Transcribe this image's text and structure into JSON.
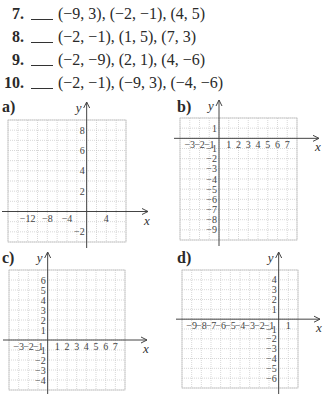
{
  "problems": [
    {
      "number": "7.",
      "points": "(−9, 3), (−2, −1), (4, 5)"
    },
    {
      "number": "8.",
      "points": "(−2, −1), (1, 5), (7, 3)"
    },
    {
      "number": "9.",
      "points": "(−2, −9), (2, 1), (4, −6)"
    },
    {
      "number": "10.",
      "points": "(−2, −1), (−9, 3), (−4, −6)"
    }
  ],
  "graphs": [
    {
      "label": "a)",
      "x_axis_label": "x",
      "y_axis_label": "y",
      "xmin": -16,
      "xmax": 8,
      "xstep": 2,
      "ymin": -3,
      "ymax": 9,
      "ystep": 1,
      "x_ticks": [
        {
          "v": -12,
          "t": "−12"
        },
        {
          "v": -8,
          "t": "−8"
        },
        {
          "v": -4,
          "t": "−4"
        },
        {
          "v": 4,
          "t": "4"
        }
      ],
      "y_ticks": [
        {
          "v": 8,
          "t": "8"
        },
        {
          "v": 6,
          "t": "6"
        },
        {
          "v": 4,
          "t": "4"
        },
        {
          "v": 2,
          "t": "2"
        },
        {
          "v": -2,
          "t": "−2"
        }
      ]
    },
    {
      "label": "b)",
      "x_axis_label": "x",
      "y_axis_label": "y",
      "xmin": -4,
      "xmax": 8,
      "xstep": 1,
      "ymin": -10,
      "ymax": 2,
      "ystep": 1,
      "x_ticks": [
        {
          "v": -3,
          "t": "−3"
        },
        {
          "v": -2,
          "t": "−2"
        },
        {
          "v": -1,
          "t": "−1"
        },
        {
          "v": 1,
          "t": "1"
        },
        {
          "v": 2,
          "t": "2"
        },
        {
          "v": 3,
          "t": "3"
        },
        {
          "v": 4,
          "t": "4"
        },
        {
          "v": 5,
          "t": "5"
        },
        {
          "v": 6,
          "t": "6"
        },
        {
          "v": 7,
          "t": "7"
        }
      ],
      "y_ticks": [
        {
          "v": 1,
          "t": "1"
        },
        {
          "v": -1,
          "t": "−1"
        },
        {
          "v": -2,
          "t": "−2"
        },
        {
          "v": -3,
          "t": "−3"
        },
        {
          "v": -4,
          "t": "−4"
        },
        {
          "v": -5,
          "t": "−5"
        },
        {
          "v": -6,
          "t": "−6"
        },
        {
          "v": -7,
          "t": "−7"
        },
        {
          "v": -8,
          "t": "−8"
        },
        {
          "v": -9,
          "t": "−9"
        }
      ]
    },
    {
      "label": "c)",
      "x_axis_label": "x",
      "y_axis_label": "y",
      "xmin": -4,
      "xmax": 8,
      "xstep": 1,
      "ymin": -5,
      "ymax": 7,
      "ystep": 1,
      "x_ticks": [
        {
          "v": -3,
          "t": "−3"
        },
        {
          "v": -2,
          "t": "−2"
        },
        {
          "v": -1,
          "t": "−1"
        },
        {
          "v": 1,
          "t": "1"
        },
        {
          "v": 2,
          "t": "2"
        },
        {
          "v": 3,
          "t": "3"
        },
        {
          "v": 4,
          "t": "4"
        },
        {
          "v": 5,
          "t": "5"
        },
        {
          "v": 6,
          "t": "6"
        },
        {
          "v": 7,
          "t": "7"
        }
      ],
      "y_ticks": [
        {
          "v": 6,
          "t": "6"
        },
        {
          "v": 5,
          "t": "5"
        },
        {
          "v": 4,
          "t": "4"
        },
        {
          "v": 3,
          "t": "3"
        },
        {
          "v": 2,
          "t": "2"
        },
        {
          "v": 1,
          "t": "1"
        },
        {
          "v": -1,
          "t": "−1"
        },
        {
          "v": -2,
          "t": "−2"
        },
        {
          "v": -3,
          "t": "−3"
        },
        {
          "v": -4,
          "t": "−4"
        }
      ]
    },
    {
      "label": "d)",
      "x_axis_label": "x",
      "y_axis_label": "y",
      "xmin": -10,
      "xmax": 2,
      "xstep": 1,
      "ymin": -7,
      "ymax": 5,
      "ystep": 1,
      "x_ticks": [
        {
          "v": -9,
          "t": "−9"
        },
        {
          "v": -8,
          "t": "−8"
        },
        {
          "v": -7,
          "t": "−7"
        },
        {
          "v": -6,
          "t": "−6"
        },
        {
          "v": -5,
          "t": "−5"
        },
        {
          "v": -4,
          "t": "−4"
        },
        {
          "v": -3,
          "t": "−3"
        },
        {
          "v": -2,
          "t": "−2"
        },
        {
          "v": -1,
          "t": "−1"
        },
        {
          "v": 1,
          "t": "1"
        }
      ],
      "y_ticks": [
        {
          "v": 4,
          "t": "4"
        },
        {
          "v": 3,
          "t": "3"
        },
        {
          "v": 2,
          "t": "2"
        },
        {
          "v": 1,
          "t": "1"
        },
        {
          "v": -1,
          "t": "−1"
        },
        {
          "v": -2,
          "t": "−2"
        },
        {
          "v": -3,
          "t": "−3"
        },
        {
          "v": -4,
          "t": "−4"
        },
        {
          "v": -5,
          "t": "−5"
        },
        {
          "v": -6,
          "t": "−6"
        }
      ]
    }
  ]
}
